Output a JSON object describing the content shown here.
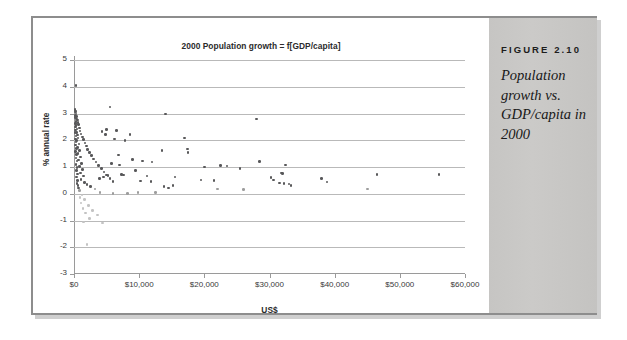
{
  "figure": {
    "label": "FIGURE 2.10",
    "caption": "Population growth vs. GDP/capita in 2000"
  },
  "chart_data": {
    "type": "scatter",
    "title": "2000 Population growth = f[GDP/capita]",
    "xlabel": "US$",
    "ylabel": "% annual rate",
    "xlim": [
      0,
      60000
    ],
    "ylim": [
      -3,
      5
    ],
    "xticks": [
      0,
      10000,
      20000,
      30000,
      40000,
      50000,
      60000
    ],
    "xticklabels": [
      "$0",
      "$10,000",
      "$20,000",
      "$30,000",
      "$40,000",
      "$50,000",
      "$60,000"
    ],
    "yticks": [
      5,
      4,
      3,
      2,
      1,
      0,
      -1,
      -2,
      -3
    ],
    "yticklabels": [
      "5",
      "4",
      "3",
      "2",
      "1",
      "0",
      "-1",
      "-2",
      "-3"
    ],
    "grid": "horizontal",
    "legend": "none",
    "marker": "filled-circle",
    "series": [
      {
        "name": "Countries",
        "points": [
          [
            300,
            4.05
          ],
          [
            150,
            3.15
          ],
          [
            200,
            3.1
          ],
          [
            260,
            3.05
          ],
          [
            320,
            2.98
          ],
          [
            180,
            2.92
          ],
          [
            420,
            2.88
          ],
          [
            240,
            2.85
          ],
          [
            360,
            2.8
          ],
          [
            500,
            2.75
          ],
          [
            280,
            2.7
          ],
          [
            600,
            2.66
          ],
          [
            190,
            2.62
          ],
          [
            700,
            2.58
          ],
          [
            330,
            2.55
          ],
          [
            210,
            2.5
          ],
          [
            820,
            2.46
          ],
          [
            450,
            2.42
          ],
          [
            260,
            2.38
          ],
          [
            950,
            2.34
          ],
          [
            380,
            2.3
          ],
          [
            170,
            2.28
          ],
          [
            1100,
            2.24
          ],
          [
            540,
            2.2
          ],
          [
            290,
            2.16
          ],
          [
            1300,
            2.12
          ],
          [
            640,
            2.08
          ],
          [
            230,
            2.05
          ],
          [
            1500,
            2.02
          ],
          [
            410,
            1.98
          ],
          [
            310,
            1.94
          ],
          [
            1700,
            1.9
          ],
          [
            760,
            1.86
          ],
          [
            250,
            1.82
          ],
          [
            1900,
            1.78
          ],
          [
            520,
            1.74
          ],
          [
            350,
            1.7
          ],
          [
            2100,
            1.66
          ],
          [
            880,
            1.62
          ],
          [
            270,
            1.58
          ],
          [
            2400,
            1.54
          ],
          [
            620,
            1.5
          ],
          [
            390,
            1.46
          ],
          [
            2700,
            1.42
          ],
          [
            1000,
            1.38
          ],
          [
            300,
            1.34
          ],
          [
            3000,
            1.3
          ],
          [
            720,
            1.26
          ],
          [
            430,
            1.22
          ],
          [
            3400,
            1.18
          ],
          [
            1150,
            1.14
          ],
          [
            330,
            1.1
          ],
          [
            3800,
            1.06
          ],
          [
            840,
            1.02
          ],
          [
            470,
            0.98
          ],
          [
            4200,
            0.94
          ],
          [
            1300,
            0.9
          ],
          [
            360,
            0.86
          ],
          [
            4600,
            0.82
          ],
          [
            960,
            0.78
          ],
          [
            510,
            0.74
          ],
          [
            5000,
            0.7
          ],
          [
            1450,
            0.66
          ],
          [
            400,
            0.62
          ],
          [
            5500,
            0.58
          ],
          [
            1080,
            0.54
          ],
          [
            560,
            0.5
          ],
          [
            6000,
            0.46
          ],
          [
            1600,
            0.42
          ],
          [
            440,
            0.38
          ],
          [
            2000,
            0.34
          ],
          [
            620,
            0.3
          ],
          [
            2500,
            0.26
          ],
          [
            700,
            0.22
          ],
          [
            3200,
            0.18
          ],
          [
            800,
            0.12
          ],
          [
            4000,
            0.05
          ],
          [
            1200,
            -0.05
          ],
          [
            900,
            -0.15
          ],
          [
            1600,
            -0.22
          ],
          [
            1100,
            -0.35
          ],
          [
            2200,
            -0.45
          ],
          [
            1400,
            -0.55
          ],
          [
            2800,
            -0.62
          ],
          [
            1800,
            -0.72
          ],
          [
            3600,
            -0.8
          ],
          [
            2400,
            -0.92
          ],
          [
            1500,
            -1.05
          ],
          [
            4400,
            -1.1
          ],
          [
            2000,
            -1.9
          ],
          [
            5500,
            3.25
          ],
          [
            14000,
            2.98
          ],
          [
            28000,
            2.8
          ],
          [
            17000,
            2.08
          ],
          [
            5000,
            2.4
          ],
          [
            4300,
            2.32
          ],
          [
            6500,
            2.36
          ],
          [
            4800,
            2.22
          ],
          [
            6200,
            2.05
          ],
          [
            7800,
            1.98
          ],
          [
            8600,
            2.22
          ],
          [
            17400,
            1.68
          ],
          [
            17500,
            1.55
          ],
          [
            13500,
            1.62
          ],
          [
            6800,
            1.45
          ],
          [
            9000,
            1.28
          ],
          [
            10500,
            1.22
          ],
          [
            12000,
            1.18
          ],
          [
            28500,
            1.2
          ],
          [
            22500,
            1.05
          ],
          [
            23500,
            1.04
          ],
          [
            20000,
            1.0
          ],
          [
            25500,
            0.95
          ],
          [
            32500,
            1.08
          ],
          [
            32000,
            0.76
          ],
          [
            31800,
            0.78
          ],
          [
            7300,
            0.72
          ],
          [
            7600,
            0.7
          ],
          [
            9400,
            0.86
          ],
          [
            11200,
            0.66
          ],
          [
            15500,
            0.62
          ],
          [
            19500,
            0.52
          ],
          [
            21500,
            0.5
          ],
          [
            30200,
            0.6
          ],
          [
            30600,
            0.52
          ],
          [
            31500,
            0.4
          ],
          [
            32200,
            0.38
          ],
          [
            33000,
            0.36
          ],
          [
            33300,
            0.3
          ],
          [
            38000,
            0.58
          ],
          [
            38800,
            0.44
          ],
          [
            46500,
            0.72
          ],
          [
            56000,
            0.72
          ],
          [
            45000,
            0.18
          ],
          [
            13800,
            0.28
          ],
          [
            14500,
            0.22
          ],
          [
            15200,
            0.3
          ],
          [
            12500,
            0.05
          ],
          [
            9800,
            0.04
          ],
          [
            8200,
            0.02
          ],
          [
            6000,
            0.0
          ],
          [
            26000,
            0.15
          ],
          [
            22000,
            0.18
          ],
          [
            10200,
            0.48
          ],
          [
            11800,
            0.46
          ],
          [
            5200,
            0.68
          ],
          [
            4500,
            0.62
          ],
          [
            3900,
            0.58
          ],
          [
            5800,
            1.12
          ],
          [
            7000,
            1.08
          ]
        ]
      }
    ]
  }
}
